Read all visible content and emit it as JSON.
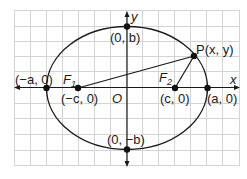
{
  "diagram": {
    "type": "ellipse-with-foci",
    "colors": {
      "grid": "#d4d4d4",
      "curve": "#1a1a1a",
      "axis": "#1a1a1a",
      "point": "#111111",
      "background": "#ffffff"
    },
    "axes": {
      "x_label": "x",
      "y_label": "y",
      "origin_label": "O"
    },
    "points": {
      "vertex_left": {
        "label": "(−a, 0)"
      },
      "vertex_right": {
        "label": "(a, 0)"
      },
      "co_vertex_top": {
        "label": "(0, b)"
      },
      "co_vertex_bottom": {
        "label": "(0, −b)"
      },
      "focus_left": {
        "name": "F",
        "sub": "1",
        "coord_label": "(−c, 0)"
      },
      "focus_right": {
        "name": "F",
        "sub": "2",
        "coord_label": "(c, 0)"
      },
      "point_p": {
        "label": "P(x, y)"
      }
    }
  }
}
